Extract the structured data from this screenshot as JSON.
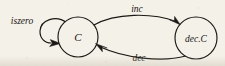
{
  "diagram": {
    "type": "state-transition-diagram",
    "background_color": "#f4f1e9",
    "ink_color": "#1a1714",
    "nodes": [
      {
        "id": "c",
        "label": "C",
        "cx": 78,
        "cy": 37,
        "r": 20
      },
      {
        "id": "dec_c",
        "label": "dec.C",
        "cx": 196,
        "cy": 38,
        "r": 21
      }
    ],
    "edges": [
      {
        "id": "self-loop",
        "label": "iszero",
        "from": "c",
        "to": "c",
        "label_x": 22,
        "label_y": 24
      },
      {
        "id": "inc",
        "label": "inc",
        "from": "c",
        "to": "dec_c",
        "label_x": 137,
        "label_y": 12
      },
      {
        "id": "dec",
        "label": "dec",
        "from": "dec_c",
        "to": "c",
        "label_x": 139,
        "label_y": 61
      }
    ]
  }
}
